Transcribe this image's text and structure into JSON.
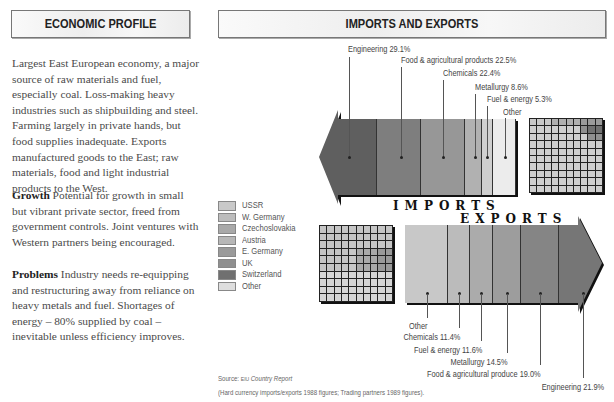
{
  "left_panel": {
    "title": "ECONOMIC PROFILE",
    "intro": "Largest East European economy, a major source of raw materials and fuel, especially coal. Loss-making heavy industries such as shipbuilding and steel. Farming largely in private hands, but food supplies inadequate. Exports manufactured goods to the East; raw materials, food and light industrial products to the West.",
    "growth_label": "Growth",
    "growth_text": " Potential for growth in small but vibrant private sector, freed from government controls. Joint ventures with Western partners being encouraged.",
    "problems_label": "Problems",
    "problems_text": " Industry needs re-equipping and restructuring away from reliance on heavy metals and fuel. Shortages of energy – 80% supplied by coal – inevitable unless efficiency improves."
  },
  "right_panel": {
    "title": "IMPORTS AND EXPORTS",
    "imports_word": "IMPORTS",
    "exports_word": "EXPORTS",
    "source_prefix": "Source: ",
    "source_eiu": "EIU ",
    "source_name": "Country Report",
    "note": "(Hard currency imports/exports 1988 figures; Trading partners 1989 figures)."
  },
  "legend": [
    {
      "label": "USSR",
      "color": "#c9c9c9"
    },
    {
      "label": "W. Germany",
      "color": "#bdbdbd"
    },
    {
      "label": "Czechoslovakia",
      "color": "#a9a9a9"
    },
    {
      "label": "Austria",
      "color": "#b7b7b7"
    },
    {
      "label": "E. Germany",
      "color": "#9a9a9a"
    },
    {
      "label": "UK",
      "color": "#8f8f8f"
    },
    {
      "label": "Switzerland",
      "color": "#707070"
    },
    {
      "label": "Other",
      "color": "#dedede"
    }
  ],
  "chart_data": [
    {
      "type": "bar",
      "title": "Imports (hard currency, 1988)",
      "orientation": "stacked-arrow-left",
      "categories": [
        "Engineering",
        "Food & agricultural products",
        "Chemicals",
        "Metallurgy",
        "Fuel & energy",
        "Other"
      ],
      "values": [
        29.1,
        22.5,
        22.4,
        8.6,
        5.3,
        12.1
      ],
      "labels": [
        "Engineering 29.1%",
        "Food & agricultural products 22.5%",
        "Chemicals 22.4%",
        "Metallurgy 8.6%",
        "Fuel & energy 5.3%",
        "Other"
      ],
      "colors": [
        "#5f5f5f",
        "#7e7e7e",
        "#979797",
        "#b1b1b1",
        "#cfcfcf",
        "#ececec"
      ],
      "unit": "%"
    },
    {
      "type": "bar",
      "title": "Exports (hard currency, 1988)",
      "orientation": "stacked-arrow-right",
      "categories": [
        "Other",
        "Chemicals",
        "Fuel & energy",
        "Metallurgy",
        "Food & agricultural produce",
        "Engineering"
      ],
      "values": [
        21.6,
        11.4,
        11.6,
        14.5,
        19.0,
        21.9
      ],
      "labels": [
        "Other",
        "Chemicals 11.4%",
        "Fuel & energy 11.6%",
        "Metallurgy 14.5%",
        "Food & agricultural produce 19.0%",
        "Engineering 21.9%"
      ],
      "colors": [
        "#c8c8c8",
        "#bbbbbb",
        "#ababab",
        "#9d9d9d",
        "#858585",
        "#767676"
      ],
      "unit": "%"
    },
    {
      "type": "heatmap",
      "title": "Import trading partners (1989) — 10×10 grid, each cell = 1%",
      "grid": "10x10"
    },
    {
      "type": "heatmap",
      "title": "Export trading partners (1989) — 10×10 grid, each cell = 1%",
      "grid": "10x10"
    }
  ]
}
